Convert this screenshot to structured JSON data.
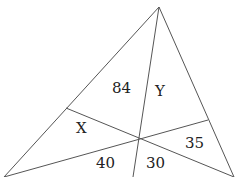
{
  "diagram": {
    "type": "triangle-with-cevians",
    "stroke_color": "#555555",
    "labels": {
      "a": "84",
      "b": "Y",
      "c": "X",
      "d": "35",
      "e": "40",
      "f": "30"
    }
  }
}
